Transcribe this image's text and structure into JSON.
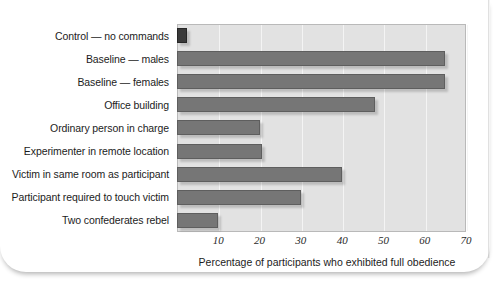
{
  "chart_data": {
    "type": "bar",
    "orientation": "horizontal",
    "title": "",
    "xlabel": "Percentage of participants who exhibited full obedience",
    "ylabel": "",
    "xlim": [
      0,
      70
    ],
    "xticks": [
      10,
      20,
      30,
      40,
      50,
      60,
      70
    ],
    "grid": true,
    "legend": "none",
    "categories": [
      "Control — no commands",
      "Baseline — males",
      "Baseline — females",
      "Office building",
      "Ordinary person in charge",
      "Experimenter in remote location",
      "Victim in same room as participant",
      "Participant required to touch victim",
      "Two confederates rebel"
    ],
    "values": [
      2.5,
      65,
      65,
      48,
      20,
      20.5,
      40,
      30,
      10
    ],
    "bar_colors": [
      "#3a3a3a",
      "#767676",
      "#767676",
      "#767676",
      "#767676",
      "#767676",
      "#767676",
      "#767676",
      "#767676"
    ],
    "plot_background": "#e2e2e2",
    "gridline_color": "#f4f4f4",
    "axis_color": "#b9b9b9"
  },
  "xaxis": {
    "title": "Percentage of participants who exhibited full obedience",
    "ticks": [
      {
        "label": "10",
        "value": 10
      },
      {
        "label": "20",
        "value": 20
      },
      {
        "label": "30",
        "value": 30
      },
      {
        "label": "40",
        "value": 40
      },
      {
        "label": "50",
        "value": 50
      },
      {
        "label": "60",
        "value": 60
      },
      {
        "label": "70",
        "value": 70
      }
    ]
  }
}
